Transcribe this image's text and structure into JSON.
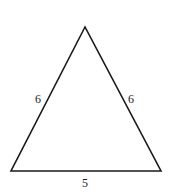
{
  "diagram": {
    "type": "triangle",
    "shape": "isosceles",
    "stroke_color": "#1a1a1a",
    "vertices": {
      "apex": [
        85,
        27
      ],
      "bottom_left": [
        11,
        171
      ],
      "bottom_right": [
        161,
        171
      ]
    },
    "sides": {
      "left": {
        "label": "6"
      },
      "right": {
        "label": "6"
      },
      "base": {
        "label": "5"
      }
    }
  }
}
